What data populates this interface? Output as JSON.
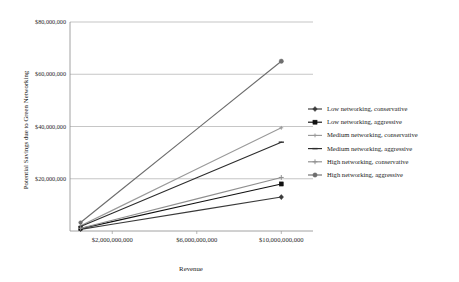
{
  "chart_data": {
    "type": "line",
    "title": "",
    "xlabel": "Revenue",
    "ylabel": "Potential Savings due to Green Networking",
    "x": [
      500000000,
      2000000000,
      6000000000,
      10000000000
    ],
    "xlim": [
      0,
      11500000000
    ],
    "ylim": [
      0,
      80000000
    ],
    "grid": true,
    "legend_position": "right",
    "xtick_labels": [
      "$2,000,000,000",
      "$6,000,000,000",
      "$10,000,000,000"
    ],
    "xtick_values": [
      2000000000,
      6000000000,
      10000000000
    ],
    "ytick_labels": [
      "$20,000,000",
      "$40,000,000",
      "$60,000,000",
      "$80,000,000"
    ],
    "ytick_values": [
      20000000,
      40000000,
      60000000,
      80000000
    ],
    "series": [
      {
        "name": "Low networking, conservative",
        "marker": "diamond",
        "color": "#3a3a3a",
        "values": [
          600000,
          2600000,
          7800000,
          13000000
        ]
      },
      {
        "name": "Low networking, aggressive",
        "marker": "square",
        "color": "#111111",
        "values": [
          900000,
          3600000,
          10800000,
          18000000
        ]
      },
      {
        "name": "Medium networking, conservative",
        "marker": "cross-small",
        "color": "#9a9a9a",
        "values": [
          1975000,
          7900000,
          23700000,
          39500000
        ]
      },
      {
        "name": "Medium networking, aggressive",
        "marker": "dash",
        "color": "#2d2d2d",
        "values": [
          1700000,
          6800000,
          20400000,
          34000000
        ]
      },
      {
        "name": "High networking, conservative",
        "marker": "plus",
        "color": "#8f8f8f",
        "values": [
          1025000,
          4100000,
          12300000,
          20500000
        ]
      },
      {
        "name": "High networking, aggressive",
        "marker": "circle",
        "color": "#6e6e6e",
        "values": [
          3250000,
          13000000,
          39000000,
          65000000
        ]
      }
    ]
  },
  "legend": {
    "items": [
      {
        "label": "Low networking, conservative"
      },
      {
        "label": "Low networking, aggressive"
      },
      {
        "label": "Medium networking, conservative"
      },
      {
        "label": "Medium networking, aggressive"
      },
      {
        "label": "High networking, conservative"
      },
      {
        "label": "High networking, aggressive"
      }
    ]
  }
}
